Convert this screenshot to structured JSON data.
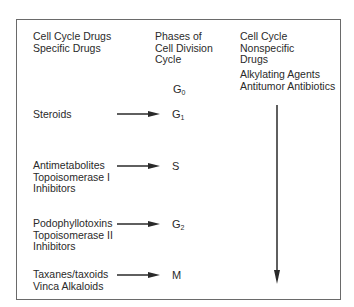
{
  "headers": {
    "left": "Cell Cycle Drugs\nSpecific Drugs",
    "middle": "Phases of\nCell Division\nCycle",
    "right": "Cell Cycle\nNonspecific\nDrugs"
  },
  "nonspecific_drugs": "Alkylating Agents\nAntitumor Antibiotics",
  "phases": [
    {
      "main": "G",
      "sub": "0"
    },
    {
      "main": "G",
      "sub": "1"
    },
    {
      "main": "S",
      "sub": ""
    },
    {
      "main": "G",
      "sub": "2"
    },
    {
      "main": "M",
      "sub": ""
    }
  ],
  "specific_drugs": [
    {
      "label": "Steroids",
      "phase": "G1"
    },
    {
      "label": "Antimetabolites\nTopoisomerase I\nInhibitors",
      "phase": "S"
    },
    {
      "label": "Podophyllotoxins\nTopoisomerase II\nInhibitors",
      "phase": "G2"
    },
    {
      "label": "Taxanes/taxoids\nVinca Alkaloids",
      "phase": "M"
    }
  ],
  "colors": {
    "text": "#2a2a2a",
    "border": "#6a6a6a",
    "arrow": "#2a2a2a"
  }
}
